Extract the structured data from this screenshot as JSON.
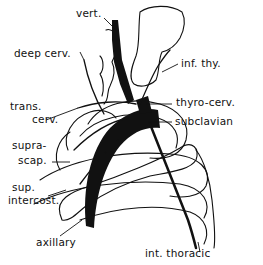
{
  "diagram": {
    "labels": [
      {
        "id": "vert",
        "text": "vert."
      },
      {
        "id": "deep_cerv",
        "text": "deep cerv."
      },
      {
        "id": "inf_thy",
        "text": "inf. thy."
      },
      {
        "id": "trans_cerv_1",
        "text": "trans."
      },
      {
        "id": "trans_cerv_2",
        "text": "cerv."
      },
      {
        "id": "thyro_cerv",
        "text": "thyro-cerv."
      },
      {
        "id": "subclavian",
        "text": "subclavian"
      },
      {
        "id": "supra_scap_1",
        "text": "supra-"
      },
      {
        "id": "supra_scap_2",
        "text": "scap."
      },
      {
        "id": "sup_intercost_1",
        "text": "sup."
      },
      {
        "id": "sup_intercost_2",
        "text": "intercost."
      },
      {
        "id": "axillary",
        "text": "axillary"
      },
      {
        "id": "int_thoracic",
        "text": "int. thoracic"
      }
    ]
  }
}
